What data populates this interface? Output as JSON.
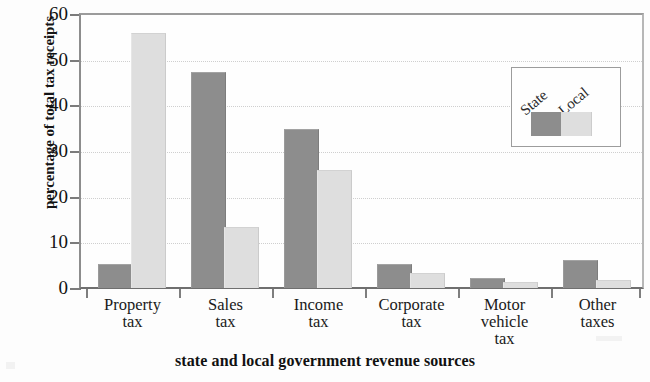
{
  "chart_data": {
    "type": "bar",
    "title": "",
    "xlabel": "state and local government revenue sources",
    "ylabel": "percentage of total tax receipts",
    "categories": [
      "Property tax",
      "Sales tax",
      "Income tax",
      "Corporate tax",
      "Motor vehicle tax",
      "Other taxes"
    ],
    "category_lines": [
      [
        "Property",
        "tax"
      ],
      [
        "Sales",
        "tax"
      ],
      [
        "Income",
        "tax"
      ],
      [
        "Corporate",
        "tax"
      ],
      [
        "Motor",
        "vehicle",
        "tax"
      ],
      [
        "Other",
        "taxes"
      ]
    ],
    "series": [
      {
        "name": "State",
        "color": "#8d8d8d",
        "values": [
          5,
          47,
          34.5,
          5,
          2,
          6
        ]
      },
      {
        "name": "Local",
        "color": "#dedede",
        "values": [
          55.5,
          13,
          25.5,
          3,
          1,
          1.5
        ]
      }
    ],
    "ylim": [
      0,
      60
    ],
    "yticks": [
      0,
      10,
      20,
      30,
      40,
      50,
      60
    ],
    "ytick_labels": [
      "0",
      "10",
      "20",
      "30",
      "40",
      "50",
      "60"
    ],
    "grid": true,
    "grid_axis": "y",
    "legend": {
      "position": "top-right",
      "entries": [
        {
          "label": "State",
          "color": "#8d8d8d"
        },
        {
          "label": "Local",
          "color": "#dedede"
        }
      ]
    }
  }
}
